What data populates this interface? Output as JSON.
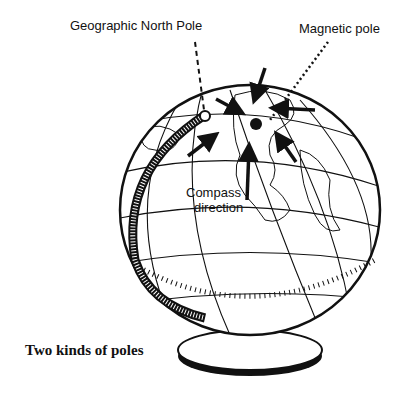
{
  "labels": {
    "geographic_pole": "Geographic North Pole",
    "magnetic_pole": "Magnetic pole",
    "compass_line1": "Compass",
    "compass_line2": "direction",
    "caption": "Two kinds of poles"
  },
  "colors": {
    "ink": "#111111",
    "paper": "#ffffff"
  }
}
